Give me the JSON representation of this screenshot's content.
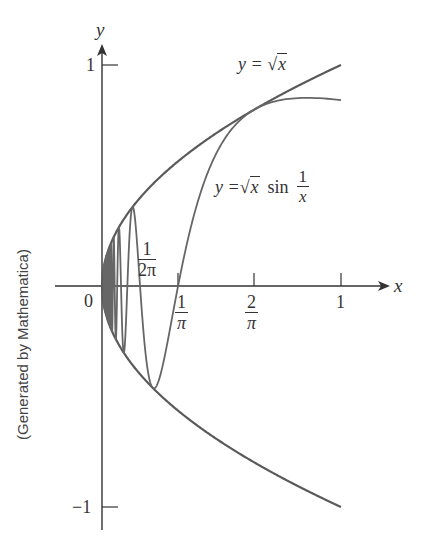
{
  "chart_data": {
    "type": "line",
    "title": "",
    "xlabel": "x",
    "ylabel": "y",
    "xlim": [
      -0.2,
      1.2
    ],
    "ylim": [
      -1.05,
      1.1
    ],
    "grid": false,
    "legend": "none (curves labeled inline)",
    "x_ticks": [
      {
        "value": 0.1592,
        "label": "1/(2π)"
      },
      {
        "value": 0.3183,
        "label": "1/π"
      },
      {
        "value": 0.6366,
        "label": "2/π"
      },
      {
        "value": 1,
        "label": "1"
      }
    ],
    "y_ticks": [
      {
        "value": 1,
        "label": "1"
      },
      {
        "value": -1,
        "label": "-1"
      }
    ],
    "origin_label": "0",
    "series": [
      {
        "name": "y = √x",
        "formula": "sqrt(x)",
        "domain": [
          0,
          1
        ],
        "x": [
          0,
          0.05,
          0.1,
          0.2,
          0.3,
          0.4,
          0.5,
          0.6,
          0.7,
          0.8,
          0.9,
          1.0
        ],
        "values": [
          0,
          0.224,
          0.316,
          0.447,
          0.548,
          0.632,
          0.707,
          0.775,
          0.837,
          0.894,
          0.949,
          1.0
        ]
      },
      {
        "name": "y = -√x",
        "formula": "-sqrt(x)",
        "domain": [
          0,
          1
        ],
        "x": [
          0,
          0.05,
          0.1,
          0.2,
          0.3,
          0.4,
          0.5,
          0.6,
          0.7,
          0.8,
          0.9,
          1.0
        ],
        "values": [
          0,
          -0.224,
          -0.316,
          -0.447,
          -0.548,
          -0.632,
          -0.707,
          -0.775,
          -0.837,
          -0.894,
          -0.949,
          -1.0
        ]
      },
      {
        "name": "y = √x sin(1/x)",
        "formula": "sqrt(x)*sin(1/x)",
        "domain": [
          0,
          1
        ],
        "x": [
          0.0531,
          0.0637,
          0.0909,
          0.1061,
          0.1592,
          0.2122,
          0.3183,
          0.4244,
          0.6366,
          0.8,
          1.0
        ],
        "values": [
          0.23,
          -0.252,
          0.301,
          -0.326,
          0.0,
          -0.461,
          0.0,
          0.0,
          0.798,
          0.85,
          0.841
        ]
      }
    ],
    "annotations": [
      {
        "text": "y = √x",
        "near": [
          0.65,
          0.98
        ]
      },
      {
        "text": "y = √x sin(1/x)",
        "near": [
          0.6,
          0.45
        ]
      },
      {
        "text": "(Generated by Mathematica)",
        "position": "left, rotated 90°"
      }
    ]
  },
  "labels": {
    "y_axis": "y",
    "x_axis": "x",
    "origin": "0",
    "y_tick_pos": "1",
    "y_tick_neg": "−1",
    "x_tick_one": "1",
    "frac_2pi_num": "1",
    "frac_2pi_den": "2π",
    "frac_pi_num": "1",
    "frac_pi_den": "π",
    "frac_2overpi_num": "2",
    "frac_2overpi_den": "π",
    "curve1_prefix": "y = ",
    "curve1_rad": "x",
    "curve2_prefix": "y = ",
    "curve2_rad": "x",
    "curve2_sin": "sin",
    "curve2_frac_num": "1",
    "curve2_frac_den": "x",
    "sqrt_symbol": "√",
    "credit": "(Generated by Mathematica)"
  },
  "colors": {
    "axis": "#333333",
    "curve": "#5a5a5a",
    "text": "#333333"
  }
}
